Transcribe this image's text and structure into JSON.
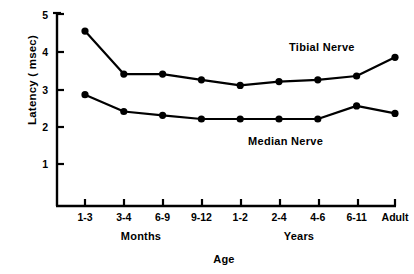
{
  "chart_data": {
    "type": "line",
    "title": "",
    "xlabel": "Age",
    "ylabel": "Latency ( msec)",
    "ylim": [
      0,
      5
    ],
    "yticks": [
      1,
      2,
      3,
      4,
      5
    ],
    "ytick_labels": [
      "1",
      "2",
      "3",
      "4",
      "5"
    ],
    "categories": [
      "1-3",
      "3-4",
      "6-9",
      "9-12",
      "1-2",
      "2-4",
      "4-6",
      "6-11",
      "Adult"
    ],
    "group_labels": [
      "Months",
      "Years"
    ],
    "grid": false,
    "legend": "inline-annotations",
    "series": [
      {
        "name": "Tibial Nerve",
        "values": [
          4.55,
          3.4,
          3.4,
          3.25,
          3.1,
          3.2,
          3.25,
          3.35,
          3.85
        ]
      },
      {
        "name": "Median Nerve",
        "values": [
          2.85,
          2.4,
          2.3,
          2.2,
          2.2,
          2.2,
          2.2,
          2.55,
          2.35
        ]
      }
    ],
    "annotations": [
      {
        "text": "Tibial Nerve",
        "near_category": "6-11"
      },
      {
        "text": "Median Nerve",
        "near_category": "4-6"
      }
    ],
    "colors": {
      "line": "#000000",
      "marker": "#000000",
      "axis": "#000000",
      "background": "#ffffff"
    }
  },
  "axis": {
    "y_label": "Latency ( msec)",
    "x_label": "Age",
    "months_label": "Months",
    "years_label": "Years"
  },
  "ticks": {
    "y": [
      "1",
      "2",
      "3",
      "4",
      "5"
    ],
    "x": [
      "1-3",
      "3-4",
      "6-9",
      "9-12",
      "1-2",
      "2-4",
      "4-6",
      "6-11",
      "Adult"
    ]
  },
  "labels": {
    "tibial": "Tibial Nerve",
    "median": "Median Nerve"
  }
}
